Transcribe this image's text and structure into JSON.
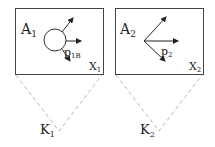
{
  "diagram": {
    "panels": [
      {
        "id": "panel-1",
        "region_label": "A",
        "region_sub": "1",
        "space_label": "X",
        "space_sub": "1",
        "arrow_label": "p",
        "arrow_sub": "1B",
        "center_shape": "circle",
        "cone_label": "K",
        "cone_sub": "1"
      },
      {
        "id": "panel-2",
        "region_label": "A",
        "region_sub": "2",
        "space_label": "X",
        "space_sub": "2",
        "arrow_label": "p",
        "arrow_sub": "2",
        "center_shape": "point",
        "cone_label": "K",
        "cone_sub": "2"
      }
    ],
    "colors": {
      "box_stroke": "#444444",
      "arrow": "#222222",
      "dashed_cone": "#b8b8b8",
      "text": "#222222"
    }
  }
}
